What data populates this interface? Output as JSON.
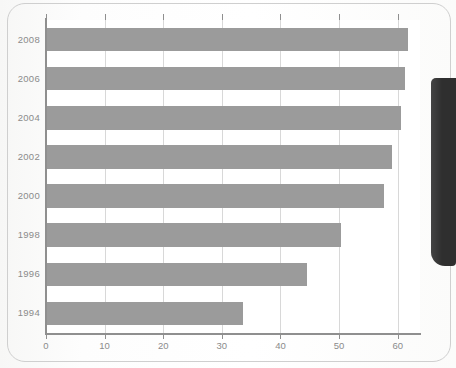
{
  "page": {
    "background_color": "#fcfcfc",
    "frame_color": "#cfcfcf",
    "bezel_color": "#2f2f2f"
  },
  "chart_data": {
    "type": "bar",
    "orientation": "horizontal",
    "title": "",
    "subtitle": "",
    "xlabel": "",
    "ylabel": "",
    "categories": [
      "2008",
      "2006",
      "2004",
      "2002",
      "2000",
      "1998",
      "1996",
      "1994"
    ],
    "values": [
      61.8,
      61.3,
      60.6,
      59.1,
      57.7,
      50.4,
      44.5,
      33.6
    ],
    "series": [
      {
        "name": "",
        "values": [
          61.8,
          61.3,
          60.6,
          59.1,
          57.7,
          50.4,
          44.5,
          33.6
        ]
      }
    ],
    "xlim": [
      0,
      63.8
    ],
    "xticks": [
      0,
      10,
      20,
      30,
      40,
      50,
      60
    ],
    "xtick_labels": [
      "0",
      "10",
      "20",
      "30",
      "40",
      "50",
      "60"
    ],
    "grid": "vertical",
    "legend": "none",
    "bar_color": "#9b9b9b",
    "grid_color": "#d8d8d8",
    "axis_color": "#8f8f8f",
    "tick_label_color": "#8b8b8b",
    "plot_background": "#ffffff"
  }
}
